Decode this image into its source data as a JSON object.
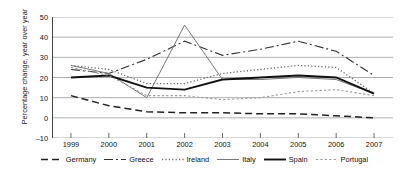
{
  "chart_data": {
    "type": "line",
    "title": "",
    "xlabel": "",
    "ylabel": "Percentage change, year over year",
    "categories": [
      "1999",
      "2000",
      "2001",
      "2002",
      "2003",
      "2004",
      "2005",
      "2006",
      "2007"
    ],
    "ylim": [
      -10,
      50
    ],
    "yticks": [
      -10,
      0,
      10,
      20,
      30,
      40,
      50
    ],
    "grid": true,
    "legend_position": "bottom",
    "series": [
      {
        "name": "Germany",
        "color": "#222222",
        "dash": "7,4",
        "width": 1.5,
        "values": [
          11,
          6,
          3,
          2.5,
          2.5,
          2,
          2,
          1,
          0
        ]
      },
      {
        "name": "Greece",
        "color": "#333333",
        "dash": "9,3,2,3",
        "width": 1.1,
        "values": [
          24,
          22,
          29,
          38,
          31,
          34,
          38,
          33,
          21
        ]
      },
      {
        "name": "Ireland",
        "color": "#666666",
        "dash": "1.2,2.2",
        "width": 1.3,
        "values": [
          26,
          24,
          17,
          17,
          22,
          24,
          26,
          25,
          12
        ]
      },
      {
        "name": "Italy",
        "color": "#777777",
        "dash": "none",
        "width": 1.0,
        "values": [
          26,
          22,
          10,
          46,
          19,
          19,
          20,
          19,
          12
        ]
      },
      {
        "name": "Spain",
        "color": "#111111",
        "dash": "none",
        "width": 1.9,
        "values": [
          20,
          21,
          15,
          14,
          19,
          20,
          21,
          20,
          12
        ]
      },
      {
        "name": "Portugal",
        "color": "#999999",
        "dash": "2.2,2.2",
        "width": 1.1,
        "values": [
          25,
          21,
          11,
          11,
          9,
          10,
          13,
          14,
          11
        ]
      }
    ]
  },
  "axis": {
    "y_title": "Percentage change, year over year"
  }
}
